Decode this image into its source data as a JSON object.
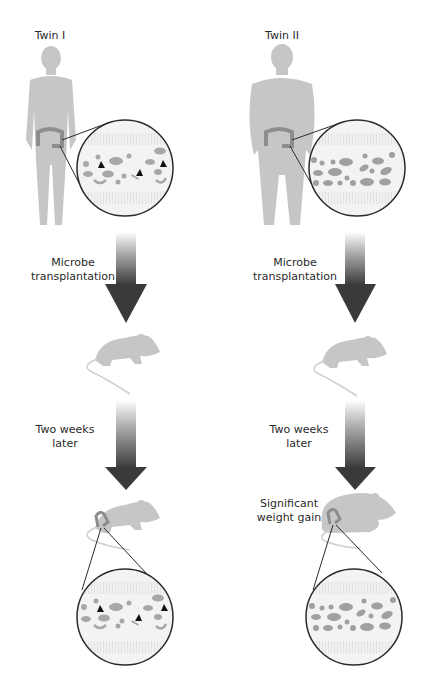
{
  "diagram": {
    "colors": {
      "silhouette": "#c4c4c4",
      "colon": "#8a8a8a",
      "circle_stroke": "#2b2b2b",
      "arrow_dark": "#3a3a3a",
      "arrow_light": "#f2f2f2",
      "triangle": "#111111"
    },
    "columns": [
      {
        "id": "twin-1",
        "subject_label": "Twin I",
        "body_type": "lean",
        "step1_label_line1": "Microbe",
        "step1_label_line2": "transplantation",
        "step2_label_line1": "Two weeks",
        "step2_label_line2": "later",
        "outcome_label_line1": "",
        "outcome_label_line2": "",
        "microbiota": "diverse (includes triangle-shaped microbes)"
      },
      {
        "id": "twin-2",
        "subject_label": "Twin II",
        "body_type": "obese",
        "step1_label_line1": "Microbe",
        "step1_label_line2": "transplantation",
        "step2_label_line1": "Two weeks",
        "step2_label_line2": "later",
        "outcome_label_line1": "Significant",
        "outcome_label_line2": "weight gain",
        "microbiota": "less diverse (no triangle-shaped microbes)"
      }
    ]
  }
}
